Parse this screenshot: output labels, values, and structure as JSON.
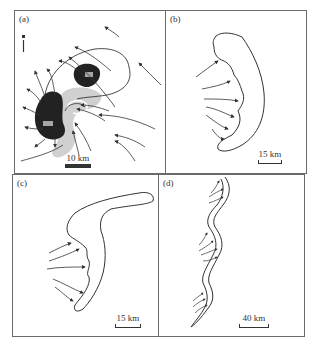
{
  "figure": {
    "panels": [
      {
        "id": "a",
        "label": "(a)",
        "scale_label": "10 km",
        "description": "Storm with dark reflectivity cores, shaded bow, curved streamlines/arrows; north arrow at top-left",
        "core_labels": [
          "",
          ""
        ]
      },
      {
        "id": "b",
        "label": "(b)",
        "scale_label": "15 km",
        "description": "Bow-shaped echo outline with inflow arrows from the west"
      },
      {
        "id": "c",
        "label": "(c)",
        "scale_label": "15 km",
        "description": "Boomerang-shaped echo outline with inflow arrows from the west"
      },
      {
        "id": "d",
        "label": "(d)",
        "scale_label": "40 km",
        "description": "Long serpentine line echo with groups of arrows at bulges"
      }
    ],
    "north_arrow": "N",
    "colors": {
      "outline": "#333333",
      "dark_core": "#222222",
      "shade": "#bdbdbd",
      "frame": "#6a6a6a"
    }
  }
}
